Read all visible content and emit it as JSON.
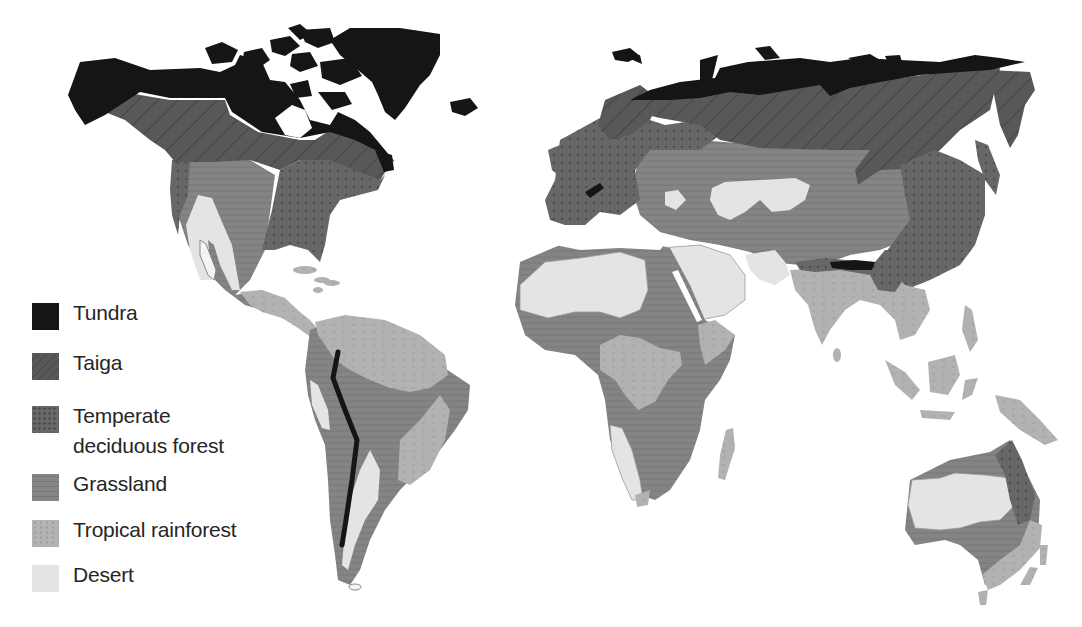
{
  "map": {
    "title": "World biomes map",
    "style": "grayscale",
    "colors": {
      "tundra": "#151515",
      "taiga": "#555555",
      "temperate_deciduous_forest": "#666666",
      "grassland": "#828282",
      "tropical_rainforest": "#b2b2b2",
      "desert": "#e4e4e4",
      "ocean": "#ffffff"
    },
    "regions_depicted": [
      "North America",
      "Greenland",
      "Central America",
      "South America",
      "Europe",
      "Asia",
      "Africa",
      "Madagascar",
      "Southeast Asia",
      "Australia",
      "New Zealand"
    ]
  },
  "legend": {
    "items": [
      {
        "key": "tundra",
        "label": "Tundra"
      },
      {
        "key": "taiga",
        "label": "Taiga"
      },
      {
        "key": "temperate",
        "label": "Temperate deciduous forest",
        "line1": "Temperate",
        "line2": "deciduous forest"
      },
      {
        "key": "grassland",
        "label": "Grassland"
      },
      {
        "key": "tropical",
        "label": "Tropical rainforest"
      },
      {
        "key": "desert",
        "label": "Desert"
      }
    ]
  }
}
